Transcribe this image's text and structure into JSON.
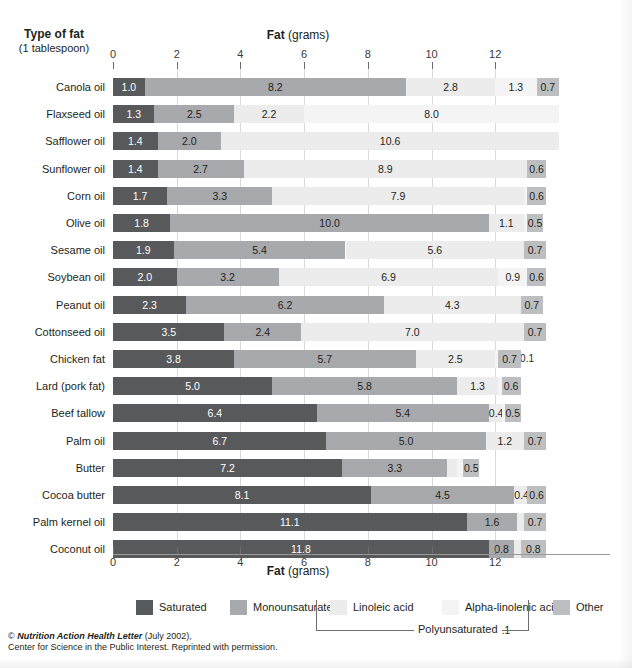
{
  "header": {
    "row_header_line1": "Type of fat",
    "row_header_line2": "(1 tablespoon)",
    "axis_title_bold": "Fat",
    "axis_title_rest": " (grams)"
  },
  "footer": {
    "line1_italic": "Nutrition Action Health Letter",
    "line1_prefix": "© ",
    "line1_suffix": " (July 2002),",
    "line2": "Center for Science in the Public Interest. Reprinted with permission."
  },
  "legend": {
    "bracket_label": "Polyunsaturated",
    "items": [
      {
        "label": "Saturated",
        "color": "#58595b"
      },
      {
        "label": "Monounsaturated",
        "color": "#a7a9ac"
      },
      {
        "label": "Linoleic acid",
        "color": "#ececec"
      },
      {
        "label": "Alpha-linolenic acid",
        "color": "#f4f4f4"
      },
      {
        "label": "Other",
        "color": "#bcbec0"
      }
    ]
  },
  "colors": {
    "saturated": "#58595b",
    "monounsaturated": "#a7a9ac",
    "linoleic": "#ececec",
    "alpha_linolenic": "#f4f4f4",
    "other": "#bcbec0",
    "gridline": "#d9d9d9",
    "tick": "#6e6e6e",
    "text": "#231f20"
  },
  "chart_data": {
    "type": "bar",
    "orientation": "horizontal",
    "stacked": true,
    "title": "",
    "xlabel": "Fat (grams)",
    "ylabel": "Type of fat (1 tablespoon)",
    "xlim": [
      0,
      14.5
    ],
    "xticks": [
      0,
      2,
      4,
      6,
      8,
      10,
      12
    ],
    "xtick_labels": [
      "0",
      "2",
      "4",
      "6",
      "8",
      "10",
      "12"
    ],
    "grid": true,
    "legend_position": "bottom",
    "series": [
      {
        "name": "Saturated",
        "key": "saturated"
      },
      {
        "name": "Monounsaturated",
        "key": "monounsaturated"
      },
      {
        "name": "Linoleic acid",
        "key": "linoleic"
      },
      {
        "name": "Alpha-linolenic acid",
        "key": "alpha_linolenic"
      },
      {
        "name": "Other",
        "key": "other"
      }
    ],
    "categories": [
      "Canola oil",
      "Flaxseed oil",
      "Safflower oil",
      "Sunflower oil",
      "Corn oil",
      "Olive oil",
      "Sesame oil",
      "Soybean oil",
      "Peanut oil",
      "Cottonseed oil",
      "Chicken fat",
      "Lard (pork fat)",
      "Beef tallow",
      "Palm oil",
      "Butter",
      "Cocoa butter",
      "Palm kernel oil",
      "Coconut oil"
    ],
    "rows": [
      {
        "category": "Canola oil",
        "saturated": 1.0,
        "monounsaturated": 8.2,
        "linoleic": 2.8,
        "alpha_linolenic": 1.3,
        "other": 0.7,
        "labels": {
          "saturated": "1.0",
          "monounsaturated": "8.2",
          "linoleic": "2.8",
          "alpha_linolenic": "1.3",
          "other": "0.7"
        },
        "above": []
      },
      {
        "category": "Flaxseed oil",
        "saturated": 1.3,
        "monounsaturated": 2.5,
        "linoleic": 2.2,
        "alpha_linolenic": 8.0,
        "other": 0.0,
        "labels": {
          "saturated": "1.3",
          "monounsaturated": "2.5",
          "linoleic": "2.2",
          "alpha_linolenic": "8.0",
          "other": ""
        },
        "above": []
      },
      {
        "category": "Safflower oil",
        "saturated": 1.4,
        "monounsaturated": 2.0,
        "linoleic": 10.6,
        "alpha_linolenic": 0.0,
        "other": 0.0,
        "labels": {
          "saturated": "1.4",
          "monounsaturated": "2.0",
          "linoleic": "10.6",
          "alpha_linolenic": "",
          "other": ""
        },
        "above": []
      },
      {
        "category": "Sunflower oil",
        "saturated": 1.4,
        "monounsaturated": 2.7,
        "linoleic": 8.9,
        "alpha_linolenic": 0.0,
        "other": 0.6,
        "labels": {
          "saturated": "1.4",
          "monounsaturated": "2.7",
          "linoleic": "8.9",
          "alpha_linolenic": "",
          "other": "0.6"
        },
        "above": []
      },
      {
        "category": "Corn oil",
        "saturated": 1.7,
        "monounsaturated": 3.3,
        "linoleic": 7.9,
        "alpha_linolenic": 0.1,
        "other": 0.6,
        "labels": {
          "saturated": "1.7",
          "monounsaturated": "3.3",
          "linoleic": "7.9",
          "alpha_linolenic": "",
          "other": "0.6"
        },
        "above": [
          {
            "text": "0.1",
            "at": 13.0
          }
        ]
      },
      {
        "category": "Olive oil",
        "saturated": 1.8,
        "monounsaturated": 10.0,
        "linoleic": 1.1,
        "alpha_linolenic": 0.1,
        "other": 0.5,
        "labels": {
          "saturated": "1.8",
          "monounsaturated": "10.0",
          "linoleic": "1.1",
          "alpha_linolenic": "",
          "other": "0.5"
        },
        "above": [
          {
            "text": "0.1",
            "at": 13.0
          }
        ]
      },
      {
        "category": "Sesame oil",
        "saturated": 1.9,
        "monounsaturated": 5.4,
        "linoleic": 5.6,
        "alpha_linolenic": 0.0,
        "other": 0.7,
        "labels": {
          "saturated": "1.9",
          "monounsaturated": "5.4",
          "linoleic": "5.6",
          "alpha_linolenic": "",
          "other": "0.7"
        },
        "above": []
      },
      {
        "category": "Soybean oil",
        "saturated": 2.0,
        "monounsaturated": 3.2,
        "linoleic": 6.9,
        "alpha_linolenic": 0.9,
        "other": 0.6,
        "labels": {
          "saturated": "2.0",
          "monounsaturated": "3.2",
          "linoleic": "6.9",
          "alpha_linolenic": "0.9",
          "other": "0.6"
        },
        "above": []
      },
      {
        "category": "Peanut oil",
        "saturated": 2.3,
        "monounsaturated": 6.2,
        "linoleic": 4.3,
        "alpha_linolenic": 0.0,
        "other": 0.7,
        "labels": {
          "saturated": "2.3",
          "monounsaturated": "6.2",
          "linoleic": "4.3",
          "alpha_linolenic": "",
          "other": "0.7"
        },
        "above": []
      },
      {
        "category": "Cottonseed oil",
        "saturated": 3.5,
        "monounsaturated": 2.4,
        "linoleic": 7.0,
        "alpha_linolenic": 0.0,
        "other": 0.7,
        "labels": {
          "saturated": "3.5",
          "monounsaturated": "2.4",
          "linoleic": "7.0",
          "alpha_linolenic": "",
          "other": "0.7"
        },
        "above": []
      },
      {
        "category": "Chicken fat",
        "saturated": 3.8,
        "monounsaturated": 5.7,
        "linoleic": 2.5,
        "alpha_linolenic": 0.1,
        "other": 0.7,
        "labels": {
          "saturated": "3.8",
          "monounsaturated": "5.7",
          "linoleic": "2.5",
          "alpha_linolenic": "",
          "other": "0.7"
        },
        "above": [
          {
            "text": "0.1",
            "at": 12.25
          }
        ]
      },
      {
        "category": "Lard (pork fat)",
        "saturated": 5.0,
        "monounsaturated": 5.8,
        "linoleic": 1.3,
        "alpha_linolenic": 0.1,
        "other": 0.6,
        "labels": {
          "saturated": "5.0",
          "monounsaturated": "5.8",
          "linoleic": "1.3",
          "alpha_linolenic": "",
          "other": "0.6"
        },
        "above": [
          {
            "text": "0.1",
            "at": 12.25
          }
        ]
      },
      {
        "category": "Beef tallow",
        "saturated": 6.4,
        "monounsaturated": 5.4,
        "linoleic": 0.4,
        "alpha_linolenic": 0.1,
        "other": 0.5,
        "labels": {
          "saturated": "6.4",
          "monounsaturated": "5.4",
          "linoleic": "0.4",
          "alpha_linolenic": "",
          "other": "0.5"
        },
        "above": [
          {
            "text": "0.1",
            "at": 12.35
          }
        ]
      },
      {
        "category": "Palm oil",
        "saturated": 6.7,
        "monounsaturated": 5.0,
        "linoleic": 1.2,
        "alpha_linolenic": 0.0,
        "other": 0.7,
        "labels": {
          "saturated": "6.7",
          "monounsaturated": "5.0",
          "linoleic": "1.2",
          "alpha_linolenic": "",
          "other": "0.7"
        },
        "above": []
      },
      {
        "category": "Butter",
        "saturated": 7.2,
        "monounsaturated": 3.3,
        "linoleic": 0.3,
        "alpha_linolenic": 0.2,
        "other": 0.5,
        "labels": {
          "saturated": "7.2",
          "monounsaturated": "3.3",
          "linoleic": "",
          "alpha_linolenic": "",
          "other": "0.5"
        },
        "above": [
          {
            "text": "0.3",
            "at": 10.65
          },
          {
            "text": "0.2",
            "at": 11.2
          }
        ]
      },
      {
        "category": "Cocoa butter",
        "saturated": 8.1,
        "monounsaturated": 4.5,
        "linoleic": 0.4,
        "alpha_linolenic": 0.0,
        "other": 0.6,
        "labels": {
          "saturated": "8.1",
          "monounsaturated": "4.5",
          "linoleic": "0.4",
          "alpha_linolenic": "",
          "other": "0.6"
        },
        "above": []
      },
      {
        "category": "Palm kernel oil",
        "saturated": 11.1,
        "monounsaturated": 1.6,
        "linoleic": 0.2,
        "alpha_linolenic": 0.0,
        "other": 0.7,
        "labels": {
          "saturated": "11.1",
          "monounsaturated": "1.6",
          "linoleic": "",
          "alpha_linolenic": "",
          "other": "0.7"
        },
        "above": [
          {
            "text": "0.2",
            "at": 12.8
          }
        ]
      },
      {
        "category": "Coconut oil",
        "saturated": 11.8,
        "monounsaturated": 0.8,
        "linoleic": 0.2,
        "alpha_linolenic": 0.0,
        "other": 0.8,
        "labels": {
          "saturated": "11.8",
          "monounsaturated": "0.8",
          "linoleic": "",
          "alpha_linolenic": "",
          "other": "0.8"
        },
        "above": [
          {
            "text": "0.2",
            "at": 13.0
          }
        ]
      }
    ]
  }
}
